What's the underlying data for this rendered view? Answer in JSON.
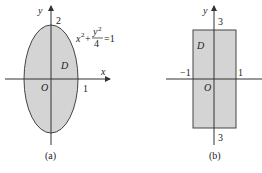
{
  "figures": [
    {
      "id": "a",
      "caption": "(a)",
      "region_label": "D",
      "origin_label": "O",
      "x_axis_label": "x",
      "y_axis_label": "y",
      "shape": "ellipse",
      "equation": {
        "lhs_term": "x",
        "lhs_exp": "2",
        "plus": "+",
        "frac_num": "y",
        "frac_num_exp": "2",
        "frac_den": "4",
        "rhs": "=1"
      },
      "tick_labels": {
        "x_right": "1",
        "y_top": "2"
      },
      "semi_axes": {
        "x": 1,
        "y": 2
      }
    },
    {
      "id": "b",
      "caption": "(b)",
      "region_label": "D",
      "origin_label": "O",
      "y_axis_label": "y",
      "shape": "rectangle",
      "tick_labels": {
        "x_left": "−1",
        "x_right": "1",
        "y_top": "3",
        "y_bottom": "3"
      },
      "bounds": {
        "x": [
          -1,
          1
        ],
        "y": [
          -3,
          3
        ]
      }
    }
  ],
  "colors": {
    "fill": "#d4d4d4",
    "stroke": "#444444",
    "axis": "#333333"
  }
}
